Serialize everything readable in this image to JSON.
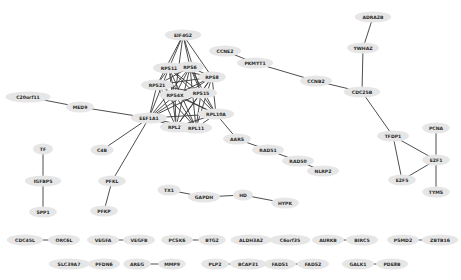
{
  "diagram": {
    "type": "protein-interaction-network",
    "node_style": {
      "fill": "#e6e6e6",
      "text": "#2a2a2a",
      "edge": "#3a3a3a"
    },
    "nodes": [
      {
        "id": "EIF4G2",
        "x": 183,
        "y": 35
      },
      {
        "id": "RPS12",
        "x": 169,
        "y": 68
      },
      {
        "id": "RPS6",
        "x": 190,
        "y": 67
      },
      {
        "id": "RPS8",
        "x": 212,
        "y": 77
      },
      {
        "id": "RPS21",
        "x": 157,
        "y": 85
      },
      {
        "id": "RPS4X",
        "x": 175,
        "y": 95
      },
      {
        "id": "RPS15",
        "x": 201,
        "y": 93
      },
      {
        "id": "RPL10A",
        "x": 216,
        "y": 114
      },
      {
        "id": "EEF1A1",
        "x": 149,
        "y": 118
      },
      {
        "id": "RPL29",
        "x": 176,
        "y": 127
      },
      {
        "id": "RPL11",
        "x": 196,
        "y": 128
      },
      {
        "id": "C20orf11",
        "x": 28,
        "y": 97
      },
      {
        "id": "MED9",
        "x": 80,
        "y": 107
      },
      {
        "id": "C4B",
        "x": 102,
        "y": 150
      },
      {
        "id": "PFKL",
        "x": 112,
        "y": 181
      },
      {
        "id": "PFKP",
        "x": 104,
        "y": 211
      },
      {
        "id": "TF",
        "x": 43,
        "y": 149
      },
      {
        "id": "IGFBP5",
        "x": 43,
        "y": 181
      },
      {
        "id": "SPP1",
        "x": 43,
        "y": 212
      },
      {
        "id": "CCNE2",
        "x": 225,
        "y": 51
      },
      {
        "id": "PKMYT1",
        "x": 255,
        "y": 63
      },
      {
        "id": "CCNB2",
        "x": 316,
        "y": 81
      },
      {
        "id": "CDC25B",
        "x": 362,
        "y": 92
      },
      {
        "id": "YWHAZ",
        "x": 363,
        "y": 48
      },
      {
        "id": "ADRA2B",
        "x": 373,
        "y": 17
      },
      {
        "id": "TFDP1",
        "x": 393,
        "y": 136
      },
      {
        "id": "PCNA",
        "x": 436,
        "y": 128
      },
      {
        "id": "E2F1",
        "x": 436,
        "y": 160
      },
      {
        "id": "E2F5",
        "x": 402,
        "y": 180
      },
      {
        "id": "TYMS",
        "x": 436,
        "y": 192
      },
      {
        "id": "AARS",
        "x": 237,
        "y": 139
      },
      {
        "id": "RAD51",
        "x": 268,
        "y": 150
      },
      {
        "id": "RAD50",
        "x": 298,
        "y": 161
      },
      {
        "id": "NLRP2",
        "x": 323,
        "y": 171
      },
      {
        "id": "TX1",
        "x": 169,
        "y": 190
      },
      {
        "id": "GAPDH",
        "x": 204,
        "y": 197
      },
      {
        "id": "HD",
        "x": 243,
        "y": 195
      },
      {
        "id": "HYPK",
        "x": 285,
        "y": 203
      },
      {
        "id": "CDC45L",
        "x": 25,
        "y": 240
      },
      {
        "id": "ORC6L",
        "x": 64,
        "y": 240
      },
      {
        "id": "VEGFA",
        "x": 103,
        "y": 240
      },
      {
        "id": "VEGFB",
        "x": 139,
        "y": 240
      },
      {
        "id": "PCSK6",
        "x": 177,
        "y": 240
      },
      {
        "id": "BTG2",
        "x": 212,
        "y": 240
      },
      {
        "id": "ALDH3A2",
        "x": 251,
        "y": 240
      },
      {
        "id": "C6orf35",
        "x": 290,
        "y": 240
      },
      {
        "id": "AURKB",
        "x": 328,
        "y": 240
      },
      {
        "id": "BIRC5",
        "x": 362,
        "y": 240
      },
      {
        "id": "PSMD2",
        "x": 403,
        "y": 240
      },
      {
        "id": "ZBTB16",
        "x": 440,
        "y": 240
      },
      {
        "id": "SLC39A7",
        "x": 69,
        "y": 264
      },
      {
        "id": "PFDN6",
        "x": 104,
        "y": 264
      },
      {
        "id": "AREG",
        "x": 137,
        "y": 264
      },
      {
        "id": "MMP9",
        "x": 172,
        "y": 264
      },
      {
        "id": "PLP2",
        "x": 215,
        "y": 264
      },
      {
        "id": "BCAP31",
        "x": 248,
        "y": 264
      },
      {
        "id": "FADS1",
        "x": 280,
        "y": 264
      },
      {
        "id": "FADS2",
        "x": 313,
        "y": 264
      },
      {
        "id": "GALK1",
        "x": 358,
        "y": 264
      },
      {
        "id": "PDE8B",
        "x": 392,
        "y": 264
      }
    ],
    "edges": [
      [
        "EIF4G2",
        "RPS12"
      ],
      [
        "EIF4G2",
        "RPS6"
      ],
      [
        "EIF4G2",
        "RPS8"
      ],
      [
        "EIF4G2",
        "RPS21"
      ],
      [
        "EIF4G2",
        "RPS4X"
      ],
      [
        "EIF4G2",
        "RPS15"
      ],
      [
        "RPS12",
        "RPS6"
      ],
      [
        "RPS12",
        "RPS8"
      ],
      [
        "RPS12",
        "RPS21"
      ],
      [
        "RPS12",
        "RPS4X"
      ],
      [
        "RPS12",
        "RPS15"
      ],
      [
        "RPS12",
        "RPL10A"
      ],
      [
        "RPS12",
        "EEF1A1"
      ],
      [
        "RPS12",
        "RPL29"
      ],
      [
        "RPS12",
        "RPL11"
      ],
      [
        "RPS6",
        "RPS8"
      ],
      [
        "RPS6",
        "RPS21"
      ],
      [
        "RPS6",
        "RPS4X"
      ],
      [
        "RPS6",
        "RPS15"
      ],
      [
        "RPS6",
        "RPL10A"
      ],
      [
        "RPS6",
        "EEF1A1"
      ],
      [
        "RPS6",
        "RPL29"
      ],
      [
        "RPS6",
        "RPL11"
      ],
      [
        "RPS8",
        "RPS21"
      ],
      [
        "RPS8",
        "RPS4X"
      ],
      [
        "RPS8",
        "RPS15"
      ],
      [
        "RPS8",
        "RPL10A"
      ],
      [
        "RPS8",
        "EEF1A1"
      ],
      [
        "RPS8",
        "RPL29"
      ],
      [
        "RPS8",
        "RPL11"
      ],
      [
        "RPS21",
        "RPS4X"
      ],
      [
        "RPS21",
        "RPS15"
      ],
      [
        "RPS21",
        "RPL10A"
      ],
      [
        "RPS21",
        "EEF1A1"
      ],
      [
        "RPS21",
        "RPL29"
      ],
      [
        "RPS21",
        "RPL11"
      ],
      [
        "RPS4X",
        "RPS15"
      ],
      [
        "RPS4X",
        "RPL10A"
      ],
      [
        "RPS4X",
        "EEF1A1"
      ],
      [
        "RPS4X",
        "RPL29"
      ],
      [
        "RPS4X",
        "RPL11"
      ],
      [
        "RPS15",
        "RPL10A"
      ],
      [
        "RPS15",
        "EEF1A1"
      ],
      [
        "RPS15",
        "RPL29"
      ],
      [
        "RPS15",
        "RPL11"
      ],
      [
        "RPL10A",
        "EEF1A1"
      ],
      [
        "RPL10A",
        "RPL29"
      ],
      [
        "RPL10A",
        "RPL11"
      ],
      [
        "EEF1A1",
        "RPL29"
      ],
      [
        "EEF1A1",
        "RPL11"
      ],
      [
        "RPL29",
        "RPL11"
      ],
      [
        "C20orf11",
        "MED9"
      ],
      [
        "MED9",
        "EEF1A1"
      ],
      [
        "EEF1A1",
        "C4B"
      ],
      [
        "EEF1A1",
        "PFKL"
      ],
      [
        "PFKL",
        "PFKP"
      ],
      [
        "TF",
        "IGFBP5"
      ],
      [
        "IGFBP5",
        "SPP1"
      ],
      [
        "RPL10A",
        "AARS"
      ],
      [
        "AARS",
        "RAD51"
      ],
      [
        "RAD51",
        "RAD50"
      ],
      [
        "RAD50",
        "NLRP2"
      ],
      [
        "CCNE2",
        "PKMYT1"
      ],
      [
        "PKMYT1",
        "CCNB2"
      ],
      [
        "CCNB2",
        "CDC25B"
      ],
      [
        "CDC25B",
        "YWHAZ"
      ],
      [
        "YWHAZ",
        "ADRA2B"
      ],
      [
        "CDC25B",
        "TFDP1"
      ],
      [
        "TFDP1",
        "E2F1"
      ],
      [
        "TFDP1",
        "E2F5"
      ],
      [
        "E2F5",
        "E2F1"
      ],
      [
        "PCNA",
        "E2F1"
      ],
      [
        "E2F1",
        "TYMS"
      ],
      [
        "TX1",
        "GAPDH"
      ],
      [
        "GAPDH",
        "HD"
      ],
      [
        "HD",
        "HYPK"
      ],
      [
        "CDC45L",
        "ORC6L"
      ],
      [
        "VEGFA",
        "VEGFB"
      ],
      [
        "PCSK6",
        "BTG2"
      ],
      [
        "ALDH3A2",
        "C6orf35"
      ],
      [
        "AURKB",
        "BIRC5"
      ],
      [
        "PSMD2",
        "ZBTB16"
      ],
      [
        "SLC39A7",
        "PFDN6"
      ],
      [
        "AREG",
        "MMP9"
      ],
      [
        "PLP2",
        "BCAP31"
      ],
      [
        "FADS1",
        "FADS2"
      ],
      [
        "GALK1",
        "PDE8B"
      ]
    ]
  }
}
